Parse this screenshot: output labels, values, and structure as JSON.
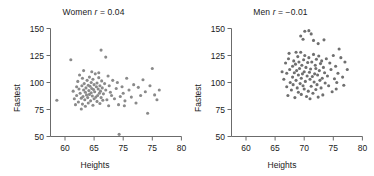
{
  "figure": {
    "type": "scatter-panel-pair",
    "background": "#ffffff",
    "marker_color": "#8a8a8a",
    "marker_color_men": "#6f6f6f",
    "axis_color": "#6b6b6b"
  },
  "panels": {
    "women": {
      "title_prefix": "Women",
      "title_r_symbol": "r",
      "title_r_value": "= 0.04",
      "title_full": "Women r = 0.04",
      "xlabel": "Heights",
      "ylabel": "Fastest",
      "xticks": [
        "60",
        "65",
        "75",
        "75",
        "80"
      ],
      "yticks": [
        "50",
        "75",
        "100",
        "125",
        "150"
      ]
    },
    "men": {
      "title_prefix": "Men",
      "title_r_symbol": "r",
      "title_r_value": "= −0.01",
      "title_full": "Men r = −0.01",
      "xlabel": "Heights",
      "ylabel": "Fastest",
      "xticks": [
        "60",
        "65",
        "70",
        "75",
        "80"
      ],
      "yticks": [
        "50",
        "75",
        "100",
        "125",
        "150"
      ]
    }
  },
  "chart_data": [
    {
      "type": "scatter",
      "title": "Women r = 0.04",
      "correlation": 0.04,
      "xlabel": "Heights",
      "ylabel": "Fastest",
      "xlim": [
        57.5,
        80
      ],
      "ylim": [
        48,
        152
      ],
      "xticks": [
        60,
        65,
        70,
        75,
        80
      ],
      "xtick_labels": [
        "60",
        "65",
        "75",
        "75",
        "80"
      ],
      "yticks": [
        50,
        75,
        100,
        125,
        150
      ],
      "grid": false,
      "legend": null,
      "marker": "circle",
      "marker_color": "#8a8a8a",
      "x": [
        58.6,
        61.0,
        61.4,
        61.6,
        61.8,
        62.0,
        62.0,
        62.2,
        62.3,
        62.4,
        62.5,
        62.6,
        62.8,
        62.9,
        63.0,
        63.0,
        63.1,
        63.2,
        63.3,
        63.4,
        63.5,
        63.5,
        63.6,
        63.7,
        63.8,
        63.9,
        64.0,
        64.0,
        64.1,
        64.2,
        64.2,
        64.3,
        64.4,
        64.5,
        64.5,
        64.6,
        64.7,
        64.8,
        64.8,
        64.9,
        65.0,
        65.0,
        65.1,
        65.2,
        65.3,
        65.4,
        65.5,
        65.5,
        65.6,
        65.7,
        65.8,
        65.9,
        66.0,
        66.0,
        66.1,
        66.2,
        66.3,
        66.4,
        66.5,
        66.6,
        66.8,
        67.0,
        67.2,
        67.4,
        67.5,
        67.6,
        67.8,
        68.0,
        68.2,
        68.5,
        68.8,
        69.0,
        69.2,
        69.5,
        69.8,
        70.0,
        70.3,
        70.6,
        71.0,
        71.4,
        71.8,
        72.2,
        72.6,
        73.0,
        73.4,
        73.8,
        74.2,
        74.6,
        75.0,
        75.4,
        75.8,
        76.2,
        66.2,
        64.6,
        63.2,
        65.8,
        67.0,
        69.3,
        70.2,
        62.8
      ],
      "y": [
        83.5,
        121.0,
        92.0,
        85.0,
        79.5,
        96.0,
        88.0,
        101.0,
        82.0,
        94.0,
        107.0,
        90.0,
        85.5,
        97.0,
        80.0,
        104.0,
        87.0,
        93.0,
        99.0,
        84.0,
        91.0,
        78.0,
        95.0,
        88.5,
        102.0,
        86.0,
        97.5,
        81.0,
        92.5,
        105.0,
        89.0,
        96.5,
        83.0,
        100.0,
        90.5,
        94.5,
        87.5,
        79.0,
        103.0,
        93.5,
        98.0,
        85.0,
        91.5,
        108.0,
        86.5,
        96.0,
        82.5,
        99.5,
        88.0,
        94.0,
        104.5,
        90.0,
        97.0,
        80.5,
        92.0,
        86.0,
        101.5,
        95.0,
        83.5,
        89.5,
        99.0,
        93.0,
        84.0,
        106.0,
        78.5,
        97.0,
        91.0,
        88.0,
        102.0,
        85.0,
        94.5,
        100.0,
        79.5,
        87.0,
        96.0,
        90.0,
        83.0,
        104.0,
        93.0,
        86.5,
        98.0,
        81.0,
        95.5,
        88.0,
        102.5,
        91.5,
        71.5,
        97.0,
        113.0,
        88.5,
        84.0,
        93.0,
        130.0,
        110.0,
        111.0,
        109.0,
        123.5,
        52.0,
        78.5,
        75.5
      ]
    },
    {
      "type": "scatter",
      "title": "Men r = −0.01",
      "correlation": -0.01,
      "xlabel": "Heights",
      "ylabel": "Fastest",
      "xlim": [
        57.5,
        80
      ],
      "ylim": [
        48,
        152
      ],
      "xticks": [
        60,
        65,
        70,
        75,
        80
      ],
      "xtick_labels": [
        "60",
        "65",
        "70",
        "75",
        "80"
      ],
      "yticks": [
        50,
        75,
        100,
        125,
        150
      ],
      "grid": false,
      "legend": null,
      "marker": "circle",
      "marker_color": "#6f6f6f",
      "x": [
        66.2,
        66.5,
        66.8,
        67.0,
        67.0,
        67.2,
        67.3,
        67.5,
        67.6,
        67.8,
        68.0,
        68.0,
        68.1,
        68.2,
        68.3,
        68.4,
        68.5,
        68.6,
        68.7,
        68.8,
        68.9,
        69.0,
        69.0,
        69.1,
        69.2,
        69.3,
        69.4,
        69.5,
        69.5,
        69.6,
        69.7,
        69.8,
        69.9,
        70.0,
        70.0,
        70.1,
        70.2,
        70.3,
        70.4,
        70.5,
        70.6,
        70.7,
        70.8,
        70.9,
        71.0,
        71.0,
        71.1,
        71.2,
        71.3,
        71.4,
        71.5,
        71.6,
        71.7,
        71.8,
        71.9,
        72.0,
        72.0,
        72.1,
        72.2,
        72.3,
        72.4,
        72.5,
        72.6,
        72.7,
        72.8,
        72.9,
        73.0,
        73.1,
        73.2,
        73.3,
        73.5,
        73.6,
        73.8,
        74.0,
        74.2,
        74.4,
        74.6,
        74.8,
        75.0,
        75.2,
        75.4,
        75.6,
        75.8,
        76.0,
        76.3,
        76.6,
        77.0,
        77.4,
        69.4,
        70.1,
        71.2,
        71.6,
        70.8,
        69.8,
        72.4,
        73.4,
        68.6,
        67.4,
        75.5,
        76.8
      ],
      "y": [
        110.0,
        103.0,
        118.0,
        96.0,
        108.5,
        88.0,
        122.0,
        112.0,
        100.0,
        93.0,
        115.0,
        105.0,
        98.0,
        120.0,
        109.0,
        86.0,
        117.0,
        102.0,
        111.0,
        95.0,
        124.0,
        107.0,
        91.0,
        119.0,
        113.0,
        99.0,
        128.0,
        104.0,
        89.0,
        116.0,
        108.0,
        97.0,
        121.0,
        110.0,
        94.0,
        125.0,
        101.0,
        114.0,
        87.0,
        106.0,
        118.5,
        92.0,
        123.0,
        109.5,
        103.0,
        85.0,
        112.5,
        96.5,
        119.0,
        105.5,
        90.0,
        126.0,
        100.5,
        108.0,
        116.0,
        113.0,
        93.5,
        121.5,
        98.0,
        107.0,
        86.5,
        124.5,
        111.0,
        102.0,
        117.5,
        95.0,
        120.0,
        104.0,
        88.5,
        114.0,
        109.0,
        99.5,
        122.0,
        106.0,
        97.0,
        118.0,
        112.0,
        91.5,
        125.0,
        103.5,
        115.0,
        100.0,
        108.5,
        131.0,
        123.0,
        105.0,
        119.0,
        112.0,
        143.0,
        147.5,
        145.0,
        139.0,
        148.0,
        140.0,
        136.0,
        139.5,
        128.0,
        127.0,
        94.0,
        97.5
      ]
    }
  ]
}
